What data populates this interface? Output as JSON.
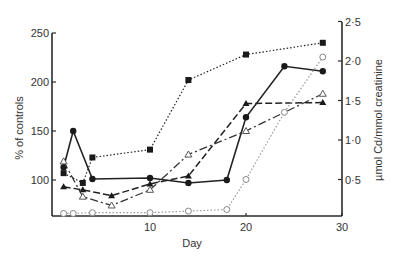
{
  "chart_data": {
    "type": "line",
    "title": "",
    "xlabel": "Day",
    "ylabel": "% of controls",
    "y2label": "µmol Cd/mmol creatinine",
    "xlim": [
      0,
      30
    ],
    "ylim": [
      65,
      250
    ],
    "y2lim": [
      0,
      2.5
    ],
    "x_ticks": [
      "10",
      "20",
      "30"
    ],
    "y_ticks": [
      "100",
      "150",
      "200",
      "250"
    ],
    "y2_ticks": [
      "0·5",
      "1·0",
      "1·5",
      "2·0",
      "2·5"
    ],
    "grid": false,
    "legend": "none",
    "series": [
      {
        "name": "filled circles (solid)",
        "axis": "left",
        "marker": "filled-circle",
        "line": "solid",
        "x": [
          1,
          2,
          4,
          10,
          14,
          18,
          20,
          24,
          28
        ],
        "values": [
          113,
          150,
          101,
          102,
          97,
          100,
          164,
          216,
          211
        ]
      },
      {
        "name": "filled squares (dotted)",
        "axis": "left",
        "marker": "filled-square",
        "line": "dotted",
        "x": [
          1,
          3,
          4,
          10,
          14,
          20,
          28
        ],
        "values": [
          107,
          97,
          123,
          131,
          202,
          228,
          240
        ]
      },
      {
        "name": "filled triangles (dashed)",
        "axis": "left",
        "marker": "filled-triangle",
        "line": "dashed",
        "x": [
          1,
          3,
          6,
          10,
          14,
          20,
          28
        ],
        "values": [
          93,
          90,
          84,
          96,
          104,
          178,
          179
        ]
      },
      {
        "name": "open triangles (dash-dot)",
        "axis": "left",
        "marker": "open-triangle",
        "line": "dash-dot",
        "x": [
          1,
          3,
          6,
          10,
          14,
          20,
          28
        ],
        "values": [
          119,
          83,
          74,
          90,
          126,
          150,
          188
        ]
      },
      {
        "name": "open circles (dotted, Cd excretion)",
        "axis": "right",
        "marker": "open-circle",
        "line": "dotted-gray",
        "x": [
          1,
          2,
          4,
          10,
          14,
          18,
          20,
          24,
          28
        ],
        "values": [
          0.07,
          0.07,
          0.08,
          0.08,
          0.1,
          0.12,
          0.5,
          1.35,
          2.05
        ]
      }
    ]
  },
  "labels": {
    "xlabel": "Day",
    "ylabel": "% of controls",
    "y2label": "µmol Cd/mmol creatinine"
  }
}
